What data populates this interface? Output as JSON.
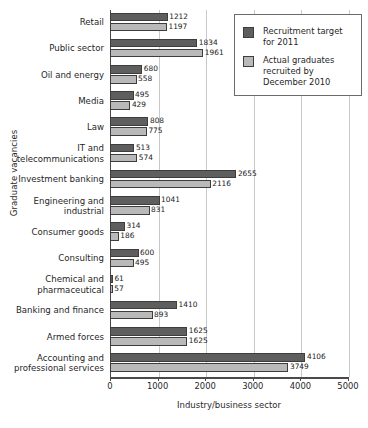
{
  "chart_data": {
    "type": "bar",
    "orientation": "horizontal",
    "title": "",
    "xlabel": "Industry/business sector",
    "ylabel": "Graduate vacancies",
    "xlim": [
      0,
      5000
    ],
    "xticks": [
      "0",
      "1000",
      "2000",
      "3000",
      "4000",
      "5000"
    ],
    "grid": "vertical",
    "legend_position": "top-right",
    "categories": [
      "Retail",
      "Public sector",
      "Oil and energy",
      "Media",
      "Law",
      "IT and\ntelecommunications",
      "Investment banking",
      "Engineering and\nindustrial",
      "Consumer goods",
      "Consulting",
      "Chemical and\npharmaceutical",
      "Banking and finance",
      "Armed forces",
      "Accounting and\nprofessional services"
    ],
    "series": [
      {
        "name": "Recruitment target for 2011",
        "color": "#5e5e5e",
        "values": [
          1212,
          1834,
          680,
          495,
          808,
          513,
          2655,
          1041,
          314,
          600,
          61,
          1410,
          1625,
          4106
        ]
      },
      {
        "name": "Actual graduates recruited by December 2010",
        "color": "#b9b9b9",
        "values": [
          1197,
          1961,
          558,
          429,
          775,
          574,
          2116,
          831,
          186,
          495,
          57,
          893,
          1625,
          3749
        ]
      }
    ]
  },
  "legend": {
    "items": [
      {
        "label": "Recruitment target\nfor 2011",
        "color": "#5e5e5e"
      },
      {
        "label": "Actual graduates\nrecruited by\nDecember 2010",
        "color": "#b9b9b9"
      }
    ]
  }
}
